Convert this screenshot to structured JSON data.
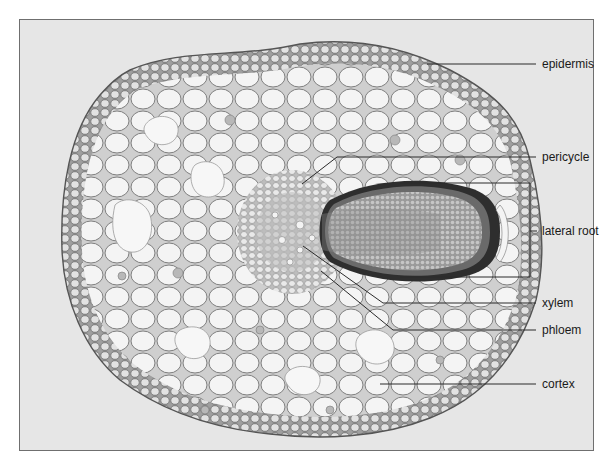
{
  "figure": {
    "background_color": "#e6e6e6",
    "border_color": "#6f6f6f",
    "labels": [
      {
        "id": "epidermis",
        "text": "epidermis",
        "x": 542,
        "y": 57
      },
      {
        "id": "pericycle",
        "text": "pericycle",
        "x": 542,
        "y": 150
      },
      {
        "id": "lateral-root",
        "text": "lateral root",
        "x": 542,
        "y": 224
      },
      {
        "id": "xylem",
        "text": "xylem",
        "x": 542,
        "y": 296
      },
      {
        "id": "phloem",
        "text": "phloem",
        "x": 542,
        "y": 323
      },
      {
        "id": "cortex",
        "text": "cortex",
        "x": 542,
        "y": 377
      }
    ],
    "colors": {
      "cell_fill": "#f1f1f1",
      "cell_stroke": "#8a8a8a",
      "dark_cell": "#b4b4b4",
      "lateral_root_core": "#8c8c8c",
      "lateral_root_rim": "#2e2e2e",
      "leader_line": "#2a2a2a"
    }
  }
}
